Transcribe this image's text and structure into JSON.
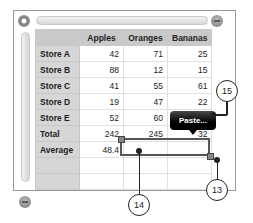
{
  "table": {
    "headers": [
      "",
      "Apples",
      "Oranges",
      "Bananas"
    ],
    "rows": [
      {
        "label": "Store A",
        "values": [
          "42",
          "71",
          "25"
        ]
      },
      {
        "label": "Store B",
        "values": [
          "88",
          "12",
          "15"
        ]
      },
      {
        "label": "Store C",
        "values": [
          "41",
          "55",
          "61"
        ]
      },
      {
        "label": "Store D",
        "values": [
          "19",
          "47",
          "22"
        ]
      },
      {
        "label": "Store E",
        "values": [
          "52",
          "60",
          ""
        ]
      },
      {
        "label": "Total",
        "values": [
          "242",
          "245",
          "32"
        ]
      },
      {
        "label": "Average",
        "values": [
          "48.4",
          "",
          ""
        ]
      },
      {
        "label": "",
        "values": [
          "",
          "",
          ""
        ]
      },
      {
        "label": "",
        "values": [
          "",
          "",
          ""
        ]
      }
    ]
  },
  "popup": {
    "paste_label": "Paste..."
  },
  "callouts": {
    "c13": "13",
    "c14": "14",
    "c15": "15"
  }
}
